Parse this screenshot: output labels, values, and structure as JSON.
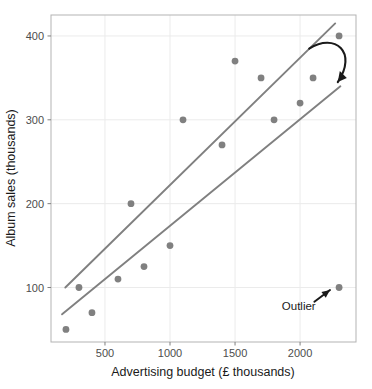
{
  "chart_data": {
    "type": "scatter",
    "title": "",
    "xlabel": "Advertising budget (£ thousands)",
    "ylabel": "Album sales (thousands)",
    "xlim": [
      85,
      2430
    ],
    "ylim": [
      35,
      425
    ],
    "xticks": [
      500,
      1000,
      1500,
      2000
    ],
    "xtick_labels": [
      "500",
      "1000",
      "1500",
      "2000"
    ],
    "yticks": [
      100,
      200,
      300,
      400
    ],
    "ytick_labels": [
      "100",
      "200",
      "300",
      "400"
    ],
    "grid": true,
    "legend": "none",
    "point_color": "#808080",
    "line_color": "#808080",
    "grid_color": "#ebebeb",
    "panel_border_color": "#b3b3b3",
    "annotation_color": "#1a1a1a",
    "points": [
      {
        "x": 200,
        "y": 50
      },
      {
        "x": 300,
        "y": 100
      },
      {
        "x": 400,
        "y": 70
      },
      {
        "x": 600,
        "y": 110
      },
      {
        "x": 700,
        "y": 200
      },
      {
        "x": 800,
        "y": 125
      },
      {
        "x": 1000,
        "y": 150
      },
      {
        "x": 1100,
        "y": 300
      },
      {
        "x": 1400,
        "y": 270
      },
      {
        "x": 1500,
        "y": 370
      },
      {
        "x": 1700,
        "y": 350
      },
      {
        "x": 1800,
        "y": 300
      },
      {
        "x": 2000,
        "y": 320
      },
      {
        "x": 2100,
        "y": 350
      },
      {
        "x": 2300,
        "y": 400
      },
      {
        "x": 2300,
        "y": 100
      }
    ],
    "series": [
      {
        "name": "fit-line-without-outlier",
        "type": "line",
        "points": [
          {
            "x": 195,
            "y": 100
          },
          {
            "x": 2270,
            "y": 415
          }
        ]
      },
      {
        "name": "fit-line-with-outlier",
        "type": "line",
        "points": [
          {
            "x": 170,
            "y": 68
          },
          {
            "x": 2310,
            "y": 340
          }
        ]
      }
    ],
    "annotations": [
      {
        "name": "outlier-label",
        "text": "Outlier",
        "x": 1990,
        "y": 78,
        "arrow_from": {
          "x": 2110,
          "y": 83
        },
        "arrow_to": {
          "x": 2230,
          "y": 97
        },
        "style": "straight"
      },
      {
        "name": "regression-shift-arrow",
        "text": "",
        "arrow_from": {
          "x": 2070,
          "y": 385
        },
        "arrow_to": {
          "x": 2290,
          "y": 345
        },
        "style": "curved"
      }
    ]
  }
}
